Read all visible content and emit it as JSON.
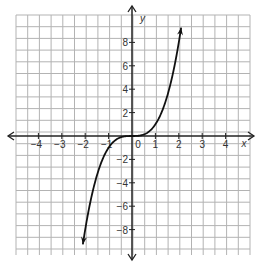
{
  "chart_data": {
    "type": "line",
    "title": "",
    "xlabel": "x",
    "ylabel": "y",
    "xlim": [
      -5,
      5
    ],
    "ylim": [
      -10,
      10
    ],
    "grid": true,
    "grid_step_x": 0.5,
    "grid_step_y": 1,
    "x_ticks": [
      -4,
      -3,
      -2,
      -1,
      1,
      2,
      3,
      4
    ],
    "y_ticks": [
      -8,
      -6,
      -4,
      -2,
      2,
      4,
      6,
      8
    ],
    "origin_label": "0",
    "series": [
      {
        "name": "y = x^3",
        "function": "x^3",
        "x": [
          -2.1,
          -2,
          -1.5,
          -1,
          -0.5,
          0,
          0.5,
          1,
          1.5,
          2,
          2.1
        ],
        "y": [
          -9.26,
          -8,
          -3.375,
          -1,
          -0.125,
          0,
          0.125,
          1,
          3.375,
          8,
          9.26
        ],
        "arrows_at_ends": true
      }
    ]
  },
  "colors": {
    "grid": "#b3b3b3",
    "axis": "#222222",
    "curve": "#111111",
    "text": "#333333"
  }
}
